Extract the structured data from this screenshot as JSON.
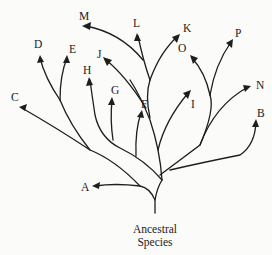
{
  "diagram": {
    "type": "phylogenetic-tree",
    "root_label_line1": "Ancestral",
    "root_label_line2": "Species",
    "species": [
      {
        "id": "A",
        "label": "A"
      },
      {
        "id": "B",
        "label": "B"
      },
      {
        "id": "C",
        "label": "C"
      },
      {
        "id": "D",
        "label": "D"
      },
      {
        "id": "E",
        "label": "E"
      },
      {
        "id": "F",
        "label": "F"
      },
      {
        "id": "G",
        "label": "G"
      },
      {
        "id": "H",
        "label": "H"
      },
      {
        "id": "I",
        "label": "I"
      },
      {
        "id": "J",
        "label": "J"
      },
      {
        "id": "K",
        "label": "K"
      },
      {
        "id": "L",
        "label": "L"
      },
      {
        "id": "M",
        "label": "M"
      },
      {
        "id": "N",
        "label": "N"
      },
      {
        "id": "O",
        "label": "O"
      },
      {
        "id": "P",
        "label": "P"
      }
    ],
    "colors": {
      "line": "#1e1e1e",
      "background": "#fbfbfa"
    }
  }
}
